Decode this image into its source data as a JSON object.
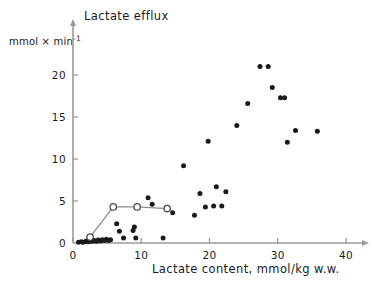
{
  "chart_data": {
    "type": "scatter",
    "title": "Lactate efflux",
    "xlabel": "Lactate content, mmol/kg w.w.",
    "ylabel": "mmol × min",
    "ylabel_exponent": "-1",
    "xlim": [
      0,
      42
    ],
    "ylim": [
      0,
      23.5
    ],
    "xticks": [
      0,
      10,
      20,
      30,
      40
    ],
    "xtick_labels": [
      "0",
      "10",
      "20",
      "30",
      "40"
    ],
    "yticks": [
      0,
      5,
      10,
      15,
      20
    ],
    "ytick_labels": [
      "0",
      "5",
      "10",
      "15",
      "20"
    ],
    "grid": false,
    "legend": null,
    "series": [
      {
        "name": "individual-measurements",
        "marker": "filled-circle",
        "color": "#1a1a1a",
        "points": [
          [
            0.8,
            0.1
          ],
          [
            1.2,
            0.15
          ],
          [
            1.5,
            0.1
          ],
          [
            1.9,
            0.2
          ],
          [
            2.2,
            0.15
          ],
          [
            2.5,
            0.25
          ],
          [
            2.8,
            0.2
          ],
          [
            3.1,
            0.3
          ],
          [
            3.4,
            0.2
          ],
          [
            3.7,
            0.35
          ],
          [
            4.0,
            0.25
          ],
          [
            4.3,
            0.4
          ],
          [
            4.6,
            0.3
          ],
          [
            4.9,
            0.45
          ],
          [
            5.2,
            0.3
          ],
          [
            5.5,
            0.4
          ],
          [
            6.4,
            2.3
          ],
          [
            6.8,
            1.4
          ],
          [
            7.4,
            0.6
          ],
          [
            8.8,
            1.5
          ],
          [
            9.0,
            1.9
          ],
          [
            9.2,
            0.6
          ],
          [
            11.0,
            5.4
          ],
          [
            11.6,
            4.6
          ],
          [
            13.2,
            0.6
          ],
          [
            14.6,
            3.6
          ],
          [
            16.2,
            9.2
          ],
          [
            17.8,
            3.3
          ],
          [
            18.6,
            5.9
          ],
          [
            19.4,
            4.3
          ],
          [
            19.8,
            12.1
          ],
          [
            20.6,
            4.4
          ],
          [
            21.0,
            6.7
          ],
          [
            21.8,
            4.4
          ],
          [
            22.4,
            6.1
          ],
          [
            24.0,
            14.0
          ],
          [
            25.6,
            16.6
          ],
          [
            27.4,
            21.0
          ],
          [
            28.6,
            21.0
          ],
          [
            29.2,
            18.5
          ],
          [
            30.4,
            17.3
          ],
          [
            31.0,
            17.3
          ],
          [
            31.4,
            12.0
          ],
          [
            32.6,
            13.4
          ],
          [
            35.8,
            13.3
          ]
        ]
      },
      {
        "name": "mean-response-curve",
        "marker": "open-circle",
        "color": "#8c8c8c",
        "connected": true,
        "points": [
          [
            2.5,
            0.7
          ],
          [
            5.9,
            4.3
          ],
          [
            9.4,
            4.3
          ],
          [
            13.8,
            4.1
          ]
        ]
      }
    ]
  }
}
